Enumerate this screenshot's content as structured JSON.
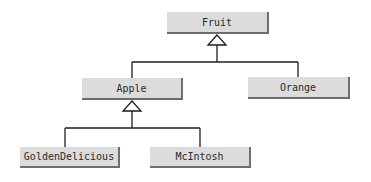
{
  "diagram": {
    "type": "UML class inheritance hierarchy",
    "nodes": [
      {
        "id": "fruit",
        "label": "Fruit"
      },
      {
        "id": "apple",
        "label": "Apple"
      },
      {
        "id": "orange",
        "label": "Orange"
      },
      {
        "id": "golden",
        "label": "GoldenDelicious"
      },
      {
        "id": "mcintosh",
        "label": "McIntosh"
      }
    ],
    "edges": [
      {
        "from": "apple",
        "to": "fruit",
        "kind": "generalization"
      },
      {
        "from": "orange",
        "to": "fruit",
        "kind": "generalization"
      },
      {
        "from": "golden",
        "to": "apple",
        "kind": "generalization"
      },
      {
        "from": "mcintosh",
        "to": "apple",
        "kind": "generalization"
      }
    ],
    "colors": {
      "node_fill": "#dcdcdc",
      "node_shadow": "#6e6e6e",
      "line": "#1e1e1e",
      "text": "#2a2a2a"
    }
  }
}
